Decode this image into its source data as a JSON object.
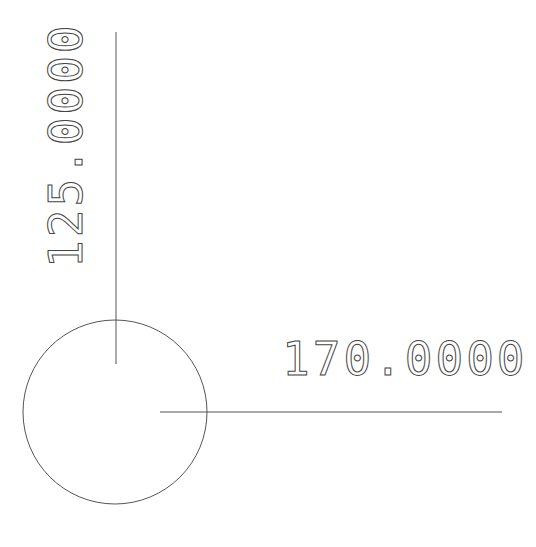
{
  "drawing": {
    "vertical_dimension": {
      "label": "125.0000"
    },
    "horizontal_dimension": {
      "label": "170.0000"
    },
    "line_color": "#555555",
    "background": "#ffffff"
  }
}
